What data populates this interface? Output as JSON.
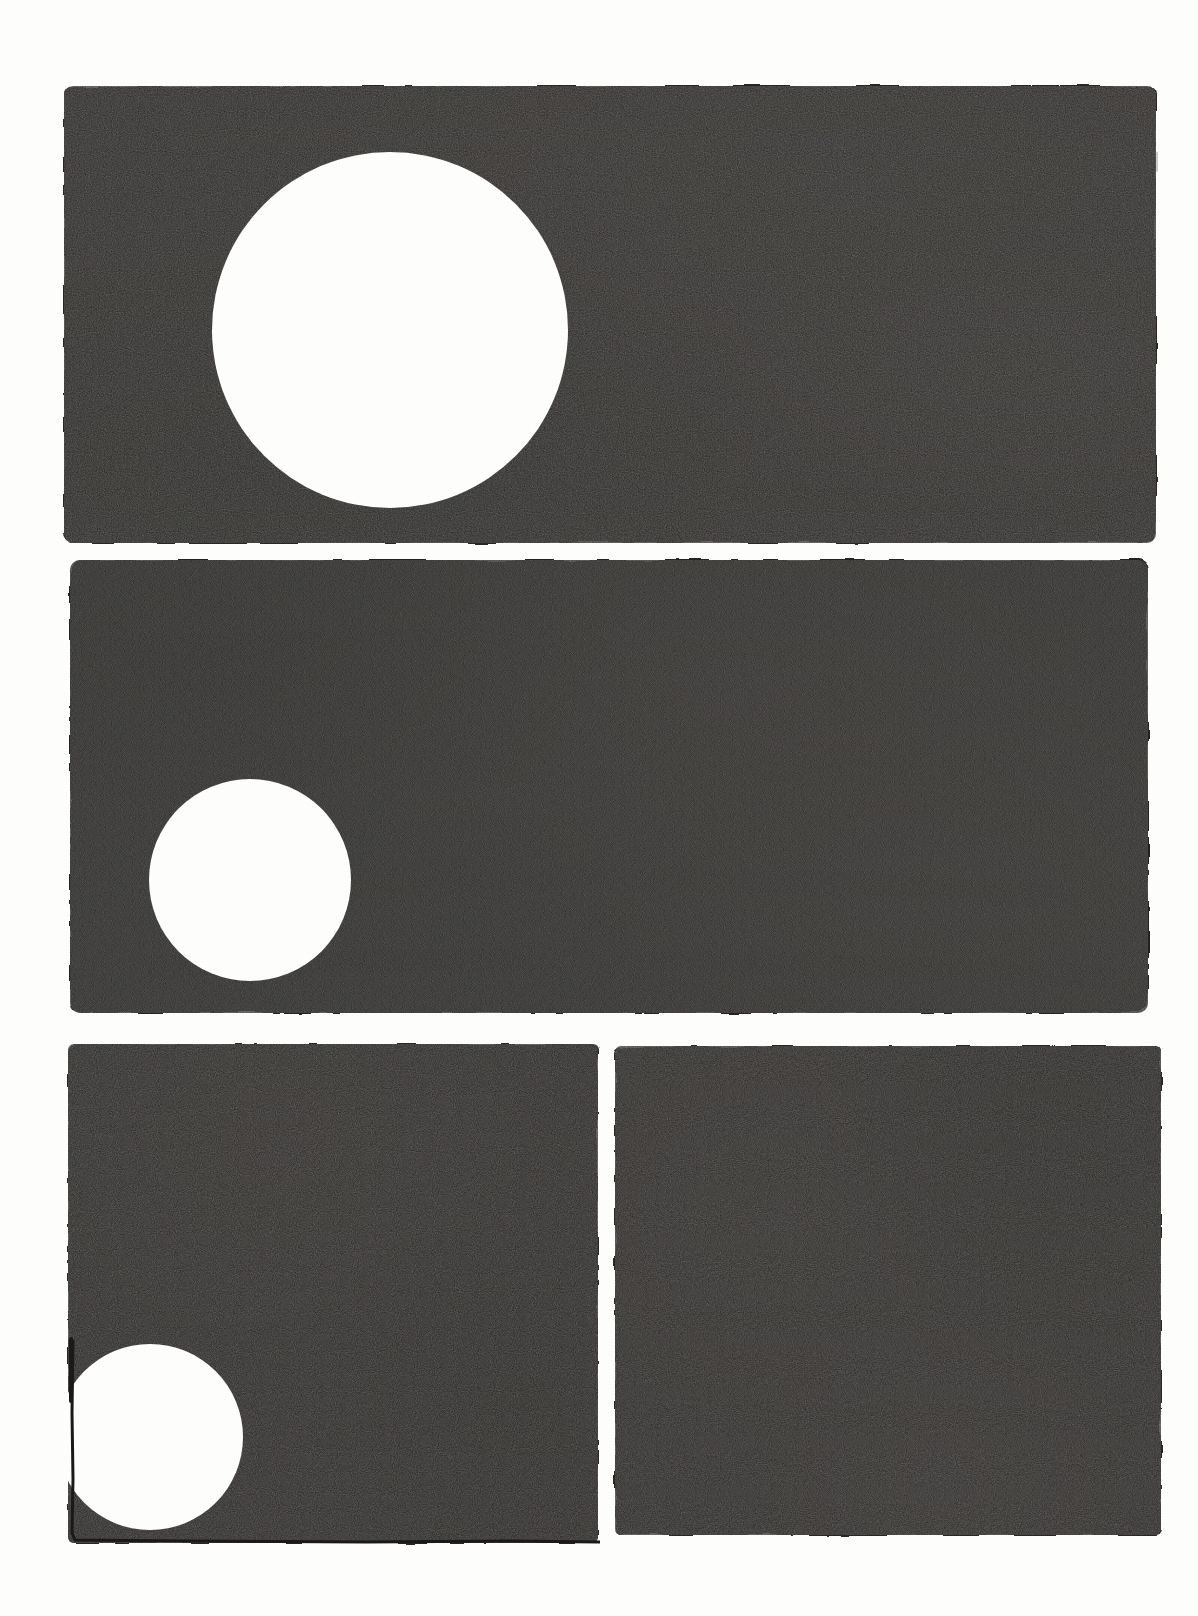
{
  "artwork": {
    "title": "Three-tier inked panel grid with white circular apertures",
    "medium": "Brush and ink on paper",
    "canvas_width": 1198,
    "canvas_height": 1616,
    "paper_color": "#fefefc",
    "ink_color": "#262422",
    "ink_color_light": "#34312e",
    "ink_color_dark": "#1a1817",
    "pen_line_color": "#1c1a18"
  },
  "panels": [
    {
      "id": "panel-1",
      "label": "Top panel",
      "order": 1,
      "x": 62,
      "y": 83,
      "width": 1096,
      "height": 462,
      "fill": "#2a2724",
      "has_pen_outline": false,
      "aperture": {
        "label": "Large white circle",
        "shape": "circle",
        "cx": 390,
        "cy": 330,
        "r": 178,
        "clipped": false
      }
    },
    {
      "id": "panel-2",
      "label": "Middle panel",
      "order": 2,
      "x": 68,
      "y": 557,
      "width": 1082,
      "height": 458,
      "fill": "#272421",
      "has_pen_outline": false,
      "aperture": {
        "label": "Medium white circle",
        "shape": "circle",
        "cx": 250,
        "cy": 880,
        "r": 101,
        "clipped": false
      }
    },
    {
      "id": "panel-3",
      "label": "Bottom-left panel",
      "order": 3,
      "x": 66,
      "y": 1041,
      "width": 534,
      "height": 504,
      "fill": "#2b2825",
      "has_pen_outline": true,
      "aperture": {
        "label": "White circle clipped by panel corner",
        "shape": "circle",
        "cx": 150,
        "cy": 1437,
        "r": 93,
        "clipped": true
      }
    },
    {
      "id": "panel-4",
      "label": "Bottom-right panel",
      "order": 4,
      "x": 613,
      "y": 1043,
      "width": 550,
      "height": 494,
      "fill": "#2a2724",
      "has_pen_outline": false,
      "aperture": null
    }
  ],
  "gutters": {
    "row_1_to_2": 12,
    "row_2_to_3": 26,
    "column_3_to_4": 13,
    "margin_left": 62,
    "margin_right": 35,
    "margin_top": 83,
    "margin_bottom": 71
  }
}
